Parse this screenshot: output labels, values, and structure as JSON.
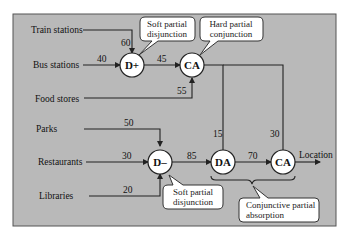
{
  "diagram": {
    "inputs": {
      "train_stations": "Train stations",
      "bus_stations": "Bus stations",
      "food_stores": "Food stores",
      "parks": "Parks",
      "restaurants": "Restaurants",
      "libraries": "Libraries"
    },
    "nodes": {
      "d_plus": "D+",
      "ca_top": "CA",
      "d_minus": "D–",
      "da": "DA",
      "ca_final": "CA"
    },
    "weights": {
      "train_to_dplus": "60",
      "bus_to_dplus": "40",
      "dplus_to_ca": "45",
      "food_to_ca": "55",
      "parks_to_dminus": "50",
      "restaurants_to_dminus": "30",
      "libraries_to_dminus": "20",
      "dminus_to_da": "85",
      "ca_to_da": "15",
      "da_to_ca": "70",
      "ca_to_ca_final": "30"
    },
    "output": "Location",
    "callouts": {
      "soft_disjunction_top": [
        "Soft partial",
        "disjunction"
      ],
      "hard_conjunction": [
        "Hard partial",
        "conjunction"
      ],
      "soft_disjunction_bottom": [
        "Soft partial",
        "disjunction"
      ],
      "conjunctive_absorption": [
        "Conjunctive partial",
        "absorption"
      ]
    },
    "colors": {
      "panel": "#b9b9b9",
      "node_fill": "#ffffff",
      "line": "#222222"
    }
  }
}
